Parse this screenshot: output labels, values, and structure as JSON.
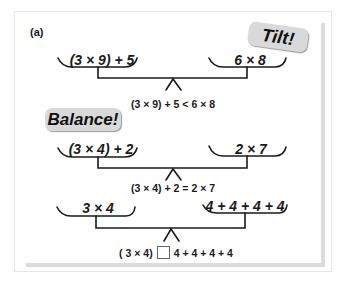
{
  "figure": {
    "panel_label": "(a)",
    "colors": {
      "ink": "#1a1a1a",
      "badge_fill": "#d9d9d9",
      "frame_border": "#e6e6e6",
      "frame_shadow": "#dcdcdc"
    },
    "scales": [
      {
        "state": "tilt",
        "badge": "Tilt!",
        "left_pan": "(3 × 9) + 5",
        "right_pan": "6 × 8",
        "equation": "(3 × 9) + 5 < 6 × 8"
      },
      {
        "state": "balance",
        "badge": "Balance!",
        "left_pan": "(3 × 4) + 2",
        "right_pan": "2 × 7",
        "equation": "(3 × 4) + 2 = 2 × 7"
      },
      {
        "state": "unknown",
        "left_pan": "3 × 4",
        "right_pan": "4 + 4 + 4 + 4",
        "equation_left": "( 3 × 4)",
        "equation_right": "4 + 4 + 4 + 4",
        "comparison_symbol_icon": "empty-box-icon"
      }
    ]
  }
}
